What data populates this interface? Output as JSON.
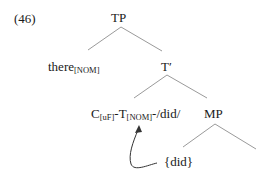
{
  "example_number": "(46)",
  "tree": {
    "root": {
      "label": "TP"
    },
    "spec": {
      "label": "there",
      "sub": "[NOM]"
    },
    "tbar": {
      "label": "T′"
    },
    "head": {
      "c": "C",
      "c_sub": "[uF]",
      "sep1": "-",
      "t": "T",
      "t_sub": "[NOM]",
      "rest": "-/did/"
    },
    "mp": {
      "label": "MP"
    },
    "moved": {
      "label": "{did}"
    }
  },
  "colors": {
    "line": "#9a9a9a",
    "text": "#1a1a1a",
    "arrow": "#333333"
  }
}
